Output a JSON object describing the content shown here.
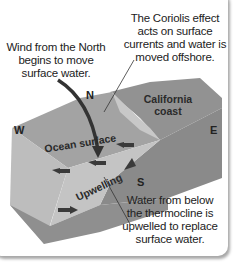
{
  "labels": {
    "coriolis": [
      "The Coriolis effect",
      "acts on surface",
      "currents and water is",
      "moved offshore."
    ],
    "wind": [
      "Wind from the North",
      "begins to move",
      "surface water."
    ],
    "upwelled": [
      "Water from below",
      "the thermocline is",
      "upwelled to replace",
      "surface water."
    ],
    "california": [
      "California",
      "coast"
    ],
    "ocean_surface": "Ocean surface",
    "upwelling": "Upwelling"
  },
  "directions": {
    "north": "N",
    "south": "S",
    "west": "W",
    "east": "E"
  },
  "colors": {
    "water_top": "#9a9a9a",
    "land": "#8c8c8c",
    "side": "#b5b5b5",
    "arrow": "#3a3a3a"
  }
}
